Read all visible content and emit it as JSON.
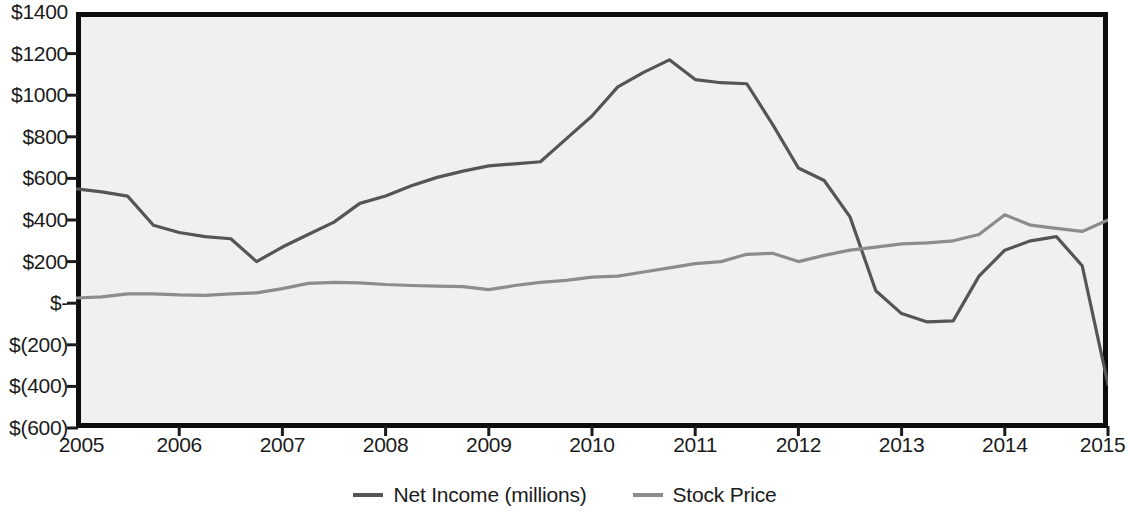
{
  "chart_data": {
    "type": "line",
    "title": "",
    "xlabel": "",
    "ylabel": "",
    "xlim": [
      2005,
      2015
    ],
    "ylim": [
      -600,
      1400
    ],
    "grid": false,
    "legend_position": "bottom-center",
    "y_tick_labels": [
      "$1400",
      "$1200",
      "$1000",
      "$800",
      "$600",
      "$400",
      "$200",
      "$-",
      "$(200)",
      "$(400)",
      "$(600)"
    ],
    "y_tick_values": [
      1400,
      1200,
      1000,
      800,
      600,
      400,
      200,
      0,
      -200,
      -400,
      -600
    ],
    "x_tick_labels": [
      "2005",
      "2006",
      "2007",
      "2008",
      "2009",
      "2010",
      "2011",
      "2012",
      "2013",
      "2014",
      "2015"
    ],
    "x_tick_values": [
      2005,
      2006,
      2007,
      2008,
      2009,
      2010,
      2011,
      2012,
      2013,
      2014,
      2015
    ],
    "series": [
      {
        "name": "Net Income (millions)",
        "color": "#555555",
        "x": [
          2005.0,
          2005.25,
          2005.5,
          2005.75,
          2006.0,
          2006.25,
          2006.5,
          2006.75,
          2007.0,
          2007.25,
          2007.5,
          2007.75,
          2008.0,
          2008.25,
          2008.5,
          2008.75,
          2009.0,
          2009.25,
          2009.5,
          2009.75,
          2010.0,
          2010.25,
          2010.5,
          2010.75,
          2011.0,
          2011.25,
          2011.5,
          2011.75,
          2012.0,
          2012.25,
          2012.5,
          2012.75,
          2013.0,
          2013.25,
          2013.5,
          2013.75,
          2014.0,
          2014.25,
          2014.5,
          2014.75,
          2015.0
        ],
        "y": [
          550,
          535,
          515,
          375,
          340,
          320,
          310,
          200,
          270,
          330,
          390,
          480,
          515,
          565,
          605,
          635,
          660,
          670,
          680,
          790,
          900,
          1040,
          1110,
          1170,
          1075,
          1060,
          1055,
          860,
          650,
          590,
          415,
          60,
          -50,
          -90,
          -85,
          130,
          255,
          300,
          320,
          180,
          -390
        ]
      },
      {
        "name": "Stock Price",
        "color": "#8c8c8c",
        "x": [
          2005.0,
          2005.25,
          2005.5,
          2005.75,
          2006.0,
          2006.25,
          2006.5,
          2006.75,
          2007.0,
          2007.25,
          2007.5,
          2007.75,
          2008.0,
          2008.25,
          2008.5,
          2008.75,
          2009.0,
          2009.25,
          2009.5,
          2009.75,
          2010.0,
          2010.25,
          2010.5,
          2010.75,
          2011.0,
          2011.25,
          2011.5,
          2011.75,
          2012.0,
          2012.25,
          2012.5,
          2012.75,
          2013.0,
          2013.25,
          2013.5,
          2013.75,
          2014.0,
          2014.25,
          2014.5,
          2014.75,
          2015.0
        ],
        "y": [
          25,
          30,
          45,
          45,
          40,
          38,
          45,
          50,
          70,
          95,
          100,
          98,
          90,
          85,
          82,
          80,
          65,
          85,
          100,
          110,
          125,
          130,
          150,
          170,
          190,
          200,
          235,
          240,
          200,
          230,
          255,
          270,
          285,
          290,
          300,
          330,
          425,
          375,
          360,
          345,
          400
        ]
      }
    ]
  },
  "legend": {
    "items": [
      {
        "label": "Net Income (millions)",
        "color": "#555555"
      },
      {
        "label": "Stock Price",
        "color": "#8c8c8c"
      }
    ]
  },
  "watermarks": {
    "upper": "CONSIDER THIS COMPANY",
    "lower": "VALUATIONS"
  }
}
